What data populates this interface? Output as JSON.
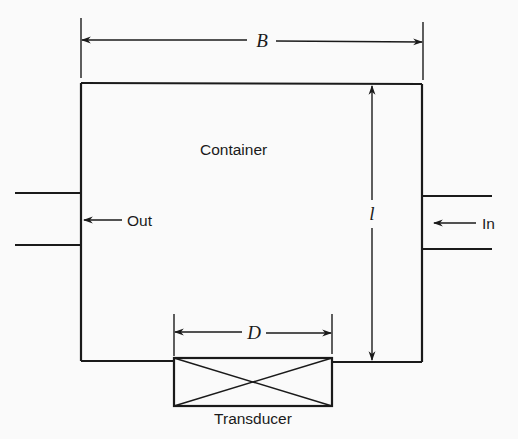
{
  "diagram": {
    "type": "schematic",
    "components": {
      "container": {
        "label": "Container"
      },
      "transducer": {
        "label": "Transducer"
      }
    },
    "flows": {
      "outlet": {
        "label": "Out",
        "side": "left"
      },
      "inlet": {
        "label": "In",
        "side": "right"
      }
    },
    "dimensions": {
      "width": {
        "symbol": "B",
        "description": "container width"
      },
      "length": {
        "symbol": "l",
        "description": "container length"
      },
      "diameter": {
        "symbol": "D",
        "description": "transducer diameter"
      }
    },
    "colors": {
      "ink": "#1a1a1a",
      "paper": "#fafafa"
    }
  }
}
